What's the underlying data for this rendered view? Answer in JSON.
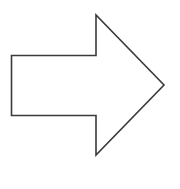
{
  "diagram": {
    "shape": "right-arrow",
    "stroke_color": "#3a3a3a",
    "fill_color": "#ffffff",
    "background": "#ffffff",
    "stroke_width": 1.6,
    "points": "11.5,55.5 96,55.5 96,15 164,85 96,155 96,115.5 11.5,115.5"
  }
}
